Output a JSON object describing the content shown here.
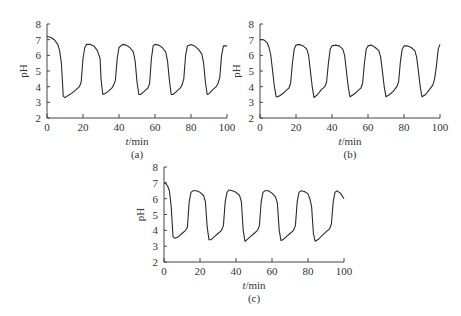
{
  "chart_data": [
    {
      "type": "line",
      "panel": "(a)",
      "xlabel": "t/min",
      "ylabel": "pH",
      "xlim": [
        0,
        100
      ],
      "ylim": [
        2,
        8
      ],
      "xticks": [
        0,
        20,
        40,
        60,
        80,
        100
      ],
      "yticks": [
        2,
        3,
        4,
        5,
        6,
        7,
        8
      ],
      "grid": false,
      "x": [
        0,
        2,
        4,
        6,
        7,
        8,
        8.5,
        9,
        10,
        12,
        14,
        16,
        18,
        19,
        20,
        21,
        22,
        24,
        26,
        28,
        29.5,
        30,
        31,
        32,
        34,
        36,
        37,
        38,
        39,
        40,
        42,
        44,
        46,
        48,
        49,
        50,
        51,
        52,
        54,
        56,
        57,
        58,
        59,
        60,
        62,
        64,
        66,
        67,
        68,
        69,
        70,
        72,
        74,
        75,
        76,
        77,
        78,
        80,
        82,
        84,
        86,
        87,
        88,
        89,
        90,
        92,
        94,
        95,
        96,
        97,
        98,
        100
      ],
      "values": [
        7.2,
        7.15,
        7.0,
        6.7,
        6.3,
        5.5,
        4.5,
        3.4,
        3.3,
        3.45,
        3.6,
        3.8,
        4.0,
        4.3,
        5.8,
        6.5,
        6.7,
        6.7,
        6.6,
        6.3,
        5.8,
        4.5,
        3.5,
        3.55,
        3.7,
        3.9,
        4.1,
        4.4,
        5.8,
        6.5,
        6.7,
        6.65,
        6.5,
        6.2,
        5.6,
        4.3,
        3.5,
        3.5,
        3.7,
        3.9,
        4.2,
        5.8,
        6.6,
        6.7,
        6.65,
        6.5,
        6.2,
        5.6,
        4.4,
        3.5,
        3.5,
        3.7,
        3.9,
        4.1,
        4.5,
        6.0,
        6.6,
        6.7,
        6.6,
        6.4,
        6.1,
        5.5,
        4.3,
        3.5,
        3.55,
        3.8,
        4.0,
        4.2,
        4.6,
        6.0,
        6.6,
        6.6
      ]
    },
    {
      "type": "line",
      "panel": "(b)",
      "xlabel": "t/min",
      "ylabel": "pH",
      "xlim": [
        0,
        100
      ],
      "ylim": [
        2,
        8
      ],
      "xticks": [
        0,
        20,
        40,
        60,
        80,
        100
      ],
      "yticks": [
        2,
        3,
        4,
        5,
        6,
        7,
        8
      ],
      "grid": false,
      "x": [
        0,
        2,
        4,
        5,
        6,
        7,
        8,
        9,
        10,
        12,
        14,
        16,
        17,
        18,
        19,
        20,
        22,
        24,
        26,
        27,
        28,
        29,
        30,
        32,
        34,
        36,
        37,
        38,
        39,
        40,
        42,
        44,
        46,
        47,
        48,
        49,
        50,
        52,
        54,
        56,
        57,
        58,
        59,
        60,
        62,
        64,
        66,
        67,
        68,
        69,
        70,
        72,
        74,
        76,
        77,
        78,
        79,
        80,
        82,
        84,
        86,
        87,
        88,
        89,
        90,
        92,
        94,
        96,
        97,
        98,
        99,
        100
      ],
      "values": [
        7.0,
        7.0,
        6.8,
        6.5,
        6.0,
        5.0,
        4.0,
        3.35,
        3.35,
        3.5,
        3.7,
        3.9,
        4.2,
        5.5,
        6.4,
        6.65,
        6.7,
        6.6,
        6.4,
        6.0,
        5.0,
        4.0,
        3.3,
        3.5,
        3.8,
        4.0,
        4.3,
        5.5,
        6.4,
        6.6,
        6.65,
        6.6,
        6.4,
        6.0,
        5.0,
        4.0,
        3.35,
        3.5,
        3.7,
        3.9,
        4.2,
        5.5,
        6.4,
        6.6,
        6.65,
        6.5,
        6.3,
        5.9,
        5.0,
        4.0,
        3.35,
        3.5,
        3.7,
        4.0,
        4.3,
        5.6,
        6.4,
        6.6,
        6.6,
        6.5,
        6.3,
        5.9,
        5.0,
        4.0,
        3.35,
        3.5,
        3.8,
        4.1,
        4.5,
        5.3,
        6.4,
        6.7
      ]
    },
    {
      "type": "line",
      "panel": "(c)",
      "xlabel": "t/min",
      "ylabel": "pH",
      "xlim": [
        0,
        100
      ],
      "ylim": [
        2,
        8
      ],
      "xticks": [
        0,
        20,
        40,
        60,
        80,
        100
      ],
      "yticks": [
        2,
        3,
        4,
        5,
        6,
        7,
        8
      ],
      "grid": false,
      "x": [
        0,
        1,
        2,
        3,
        4,
        5,
        6,
        8,
        10,
        12,
        13,
        14,
        15,
        16,
        18,
        20,
        22,
        23,
        24,
        25,
        26,
        28,
        30,
        32,
        33,
        34,
        35,
        36,
        38,
        40,
        42,
        43,
        44,
        45,
        46,
        48,
        50,
        52,
        53,
        54,
        55,
        56,
        58,
        60,
        62,
        63,
        64,
        65,
        66,
        68,
        70,
        72,
        73,
        74,
        75,
        76,
        78,
        80,
        81,
        82,
        83,
        84,
        86,
        88,
        90,
        92,
        93,
        94,
        95,
        96,
        98,
        100
      ],
      "values": [
        7.0,
        6.95,
        6.8,
        6.5,
        5.5,
        3.6,
        3.5,
        3.6,
        3.8,
        4.0,
        4.2,
        5.8,
        6.4,
        6.5,
        6.5,
        6.4,
        6.2,
        5.8,
        4.2,
        3.4,
        3.4,
        3.6,
        3.8,
        4.0,
        4.3,
        5.8,
        6.4,
        6.55,
        6.5,
        6.4,
        6.2,
        5.8,
        4.0,
        3.3,
        3.4,
        3.6,
        3.8,
        4.0,
        4.3,
        5.8,
        6.4,
        6.5,
        6.5,
        6.35,
        6.1,
        5.7,
        4.0,
        3.35,
        3.4,
        3.6,
        3.8,
        4.0,
        4.3,
        5.8,
        6.4,
        6.5,
        6.45,
        6.3,
        6.0,
        5.5,
        3.8,
        3.3,
        3.45,
        3.7,
        3.9,
        4.1,
        4.4,
        5.8,
        6.4,
        6.5,
        6.35,
        6.0
      ]
    }
  ],
  "panels": [
    {
      "id": "a",
      "caption": "(a)",
      "xlabel_italic": "t",
      "xlabel_rest": "/min",
      "ylabel": "pH"
    },
    {
      "id": "b",
      "caption": "(b)",
      "xlabel_italic": "t",
      "xlabel_rest": "/min",
      "ylabel": "pH"
    },
    {
      "id": "c",
      "caption": "(c)",
      "xlabel_italic": "t",
      "xlabel_rest": "/min",
      "ylabel": "pH"
    }
  ],
  "style": {
    "line_color": "#2a2a2a",
    "axis_color": "#444444"
  }
}
